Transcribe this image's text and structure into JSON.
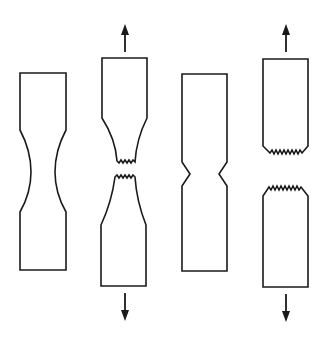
{
  "figure": {
    "colors": {
      "line": "#1a1a1a",
      "background": "#ffffff"
    },
    "specimens": [
      {
        "id": "ductile-necked",
        "label": "Ductile specimen, necked (unbroken)",
        "state": "necked"
      },
      {
        "id": "ductile-fractured",
        "label": "Ductile specimen, fractured (cup-and-cone)",
        "state": "fractured",
        "arrows": [
          "up",
          "down"
        ]
      },
      {
        "id": "notched",
        "label": "Notched specimen (unbroken)",
        "state": "notched"
      },
      {
        "id": "brittle-fractured",
        "label": "Brittle specimen, fractured",
        "state": "fractured",
        "arrows": [
          "up",
          "down"
        ]
      }
    ],
    "icons": {
      "tension_up": "arrow-up-icon",
      "tension_down": "arrow-down-icon"
    }
  }
}
